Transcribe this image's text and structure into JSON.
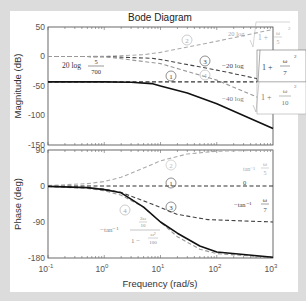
{
  "chart_data": [
    {
      "type": "line",
      "title": "Bode Diagram",
      "xlabel": "Frequency (rad/s)",
      "ylabel": "Magnitude (dB)",
      "xscale": "log",
      "xlim": [
        0.1,
        1000
      ],
      "ylim": [
        -150,
        50
      ],
      "yticks": [
        50,
        0,
        -50,
        -100,
        -150
      ],
      "xticks": [
        "10^-1",
        "10^0",
        "10^1",
        "10^2",
        "10^3"
      ],
      "grid": false,
      "series": [
        {
          "name": "1",
          "label": "20 log 5/700",
          "style": "dashed",
          "color": "#333333",
          "x": [
            0.1,
            1,
            10,
            100,
            1000
          ],
          "values": [
            -43,
            -43,
            -43,
            -43,
            -43
          ]
        },
        {
          "name": "2",
          "label": "20 log sqrt(1+(w/5)^2)",
          "style": "dashed",
          "color": "#aaaaaa",
          "x": [
            0.1,
            1,
            5,
            10,
            100,
            1000
          ],
          "values": [
            0,
            0.2,
            3,
            7,
            26,
            46
          ]
        },
        {
          "name": "3",
          "label": "-20 log sqrt(1+(w/7)^2)",
          "style": "dashed",
          "color": "#444444",
          "x": [
            0.1,
            1,
            7,
            10,
            100,
            1000
          ],
          "values": [
            0,
            -0.1,
            -3,
            -5,
            -23,
            -43
          ]
        },
        {
          "name": "4",
          "label": "-40 log sqrt(1+(w/10)^2)",
          "style": "dashed",
          "color": "#999999",
          "x": [
            0.1,
            1,
            10,
            100,
            1000
          ],
          "values": [
            0,
            -0.2,
            -12,
            -40,
            -80
          ]
        },
        {
          "name": "total",
          "label": "Total magnitude",
          "style": "solid",
          "color": "#111111",
          "x": [
            0.1,
            1,
            3,
            7,
            10,
            30,
            100,
            1000
          ],
          "values": [
            -43,
            -43,
            -43.5,
            -46,
            -50,
            -62,
            -80,
            -122
          ]
        }
      ]
    },
    {
      "type": "line",
      "xlabel": "Frequency (rad/s)",
      "ylabel": "Phase (deg)",
      "xscale": "log",
      "xlim": [
        0.1,
        1000
      ],
      "ylim": [
        -180,
        90
      ],
      "yticks": [
        90,
        0,
        -90,
        -180
      ],
      "xticks": [
        "10^-1",
        "10^0",
        "10^1",
        "10^2",
        "10^3"
      ],
      "grid": false,
      "series": [
        {
          "name": "1",
          "label": "0",
          "style": "dashed",
          "color": "#333333",
          "x": [
            0.1,
            1000
          ],
          "values": [
            0,
            0
          ]
        },
        {
          "name": "2",
          "label": "tan^-1 w/5",
          "style": "dashed",
          "color": "#aaaaaa",
          "x": [
            0.1,
            0.5,
            1,
            2,
            5,
            10,
            30,
            100,
            1000
          ],
          "values": [
            1,
            6,
            11,
            22,
            45,
            63,
            80,
            87,
            90
          ]
        },
        {
          "name": "3",
          "label": "-tan^-1 w/7",
          "style": "dashed",
          "color": "#444444",
          "x": [
            0.1,
            0.5,
            1,
            2,
            7,
            20,
            70,
            1000
          ],
          "values": [
            -1,
            -4,
            -8,
            -16,
            -45,
            -71,
            -84,
            -90
          ]
        },
        {
          "name": "4",
          "label": "-tan^-1 (2w/10)/(1-w^2/100)",
          "style": "dashed",
          "color": "#999999",
          "x": [
            0.1,
            0.5,
            1,
            2,
            5,
            10,
            20,
            50,
            100,
            1000
          ],
          "values": [
            -1,
            -6,
            -12,
            -23,
            -53,
            -90,
            -127,
            -158,
            -169,
            -179
          ]
        },
        {
          "name": "total",
          "label": "Total phase",
          "style": "solid",
          "color": "#111111",
          "x": [
            0.1,
            0.5,
            1,
            2,
            5,
            10,
            20,
            50,
            100,
            1000
          ],
          "values": [
            -1,
            -4,
            -9,
            -17,
            -53,
            -90,
            -118,
            -150,
            -165,
            -178
          ]
        }
      ]
    }
  ],
  "figure": {
    "title": "Bode Diagram",
    "xlabel": "Frequency (rad/s)",
    "mag_ylabel": "Magnitude (dB)",
    "phase_ylabel": "Phase (deg)",
    "mag_yticks": [
      "50",
      "0",
      "-50",
      "-100",
      "-150"
    ],
    "phase_yticks": [
      "90",
      "0",
      "-90",
      "-180"
    ],
    "x_base": "10",
    "x_exps": [
      "-1",
      "0",
      "1",
      "2",
      "3"
    ]
  },
  "annotations": {
    "mag": {
      "circle1": "1",
      "circle2": "2",
      "circle3": "3",
      "circle4": "4",
      "gain_prefix": "20 log",
      "gain_num": "5",
      "gain_den": "700",
      "f2_prefix": "20 log",
      "f2_body": "1 + ",
      "f2_num": "ω",
      "f2_den": "5",
      "f2_pow": "2",
      "f3_prefix": "−20 log",
      "f3_body": "1 + ",
      "f3_num": "ω",
      "f3_den": "7",
      "f3_pow": "2",
      "f4_prefix": "−40 log",
      "f4_body": "1 + ",
      "f4_num": "ω",
      "f4_den": "10",
      "f4_pow": "2"
    },
    "phase": {
      "circle1": "1",
      "circle2": "2",
      "circle3": "3",
      "circle4": "4",
      "p1": "0",
      "p2_prefix": "tan⁻¹",
      "p2_num": "ω",
      "p2_den": "5",
      "p3_prefix": "−tan⁻¹",
      "p3_num": "ω",
      "p3_den": "7",
      "p4_prefix": "−tan⁻¹",
      "p4_num_num": "2ω",
      "p4_num_den": "10",
      "p4_den_lead": "1 −",
      "p4_den_num": "ω²",
      "p4_den_den": "100"
    }
  }
}
